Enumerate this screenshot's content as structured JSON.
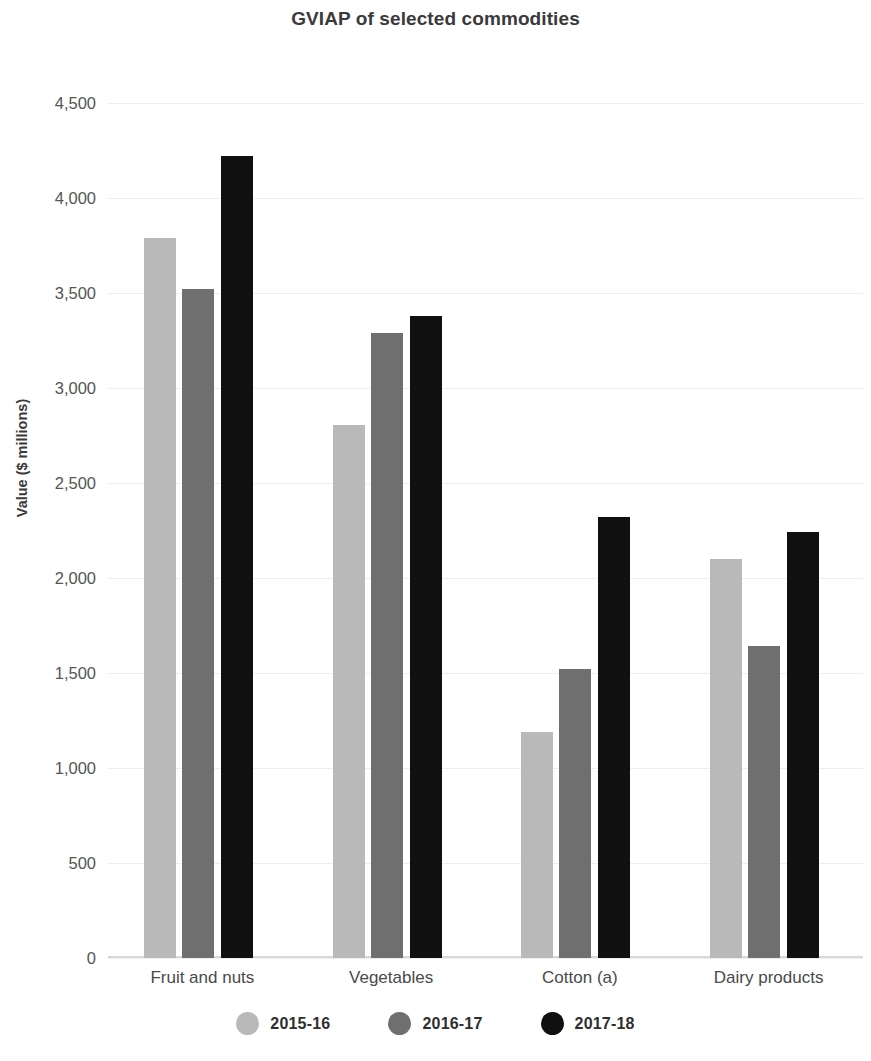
{
  "chart_data": {
    "type": "bar",
    "title": "GVIAP of selected commodities",
    "xlabel": "",
    "ylabel": "Value ($ millions)",
    "categories": [
      "Fruit and nuts",
      "Vegetables",
      "Cotton (a)",
      "Dairy products"
    ],
    "series": [
      {
        "name": "2015-16",
        "color": "#b9b9b9",
        "values": [
          3790,
          2805,
          1190,
          2100
        ]
      },
      {
        "name": "2016-17",
        "color": "#6f6f6f",
        "values": [
          3520,
          3290,
          1520,
          1640
        ]
      },
      {
        "name": "2017-18",
        "color": "#101010",
        "values": [
          4220,
          3380,
          2320,
          2240
        ]
      }
    ],
    "ylim": [
      0,
      4500
    ],
    "ytick_values": [
      4500,
      4000,
      3500,
      3000,
      2500,
      2000,
      1500,
      1000,
      500,
      0
    ],
    "ytick_labels": [
      "4,500",
      "4,000",
      "3,500",
      "3,000",
      "2,500",
      "2,000",
      "1,500",
      "1,000",
      "500",
      "0"
    ],
    "grid": true,
    "legend_position": "bottom",
    "legend_marker": "circle"
  },
  "colors": {
    "gridline": "#eceff1",
    "axis": "#d8d8d8",
    "text": "#3f3f3f",
    "background": "#ffffff"
  }
}
